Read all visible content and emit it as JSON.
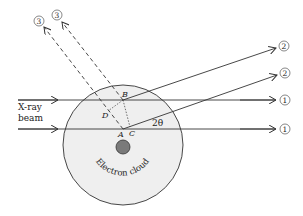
{
  "diagram": {
    "beam_label_line1": "X-ray",
    "beam_label_line2": "beam",
    "cloud_label": "Electron cloud",
    "angle_label": "2θ",
    "points": {
      "A": "A",
      "B": "B",
      "C": "C",
      "D": "D"
    },
    "ray_markers": {
      "ray1_upper": "1",
      "ray1_lower": "1",
      "ray2_upper": "2",
      "ray2_lower": "2",
      "ray3_left": "3",
      "ray3_right": "3"
    },
    "colors": {
      "cloud_fill": "#efefef",
      "nucleus_fill": "#7a7a7a",
      "line": "#333333"
    }
  }
}
